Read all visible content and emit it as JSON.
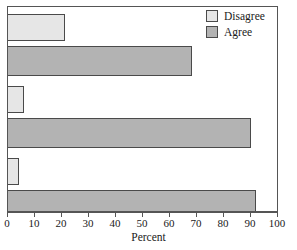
{
  "chart_data": {
    "type": "bar",
    "orientation": "horizontal",
    "title": "",
    "xlabel": "Percent",
    "ylabel": "",
    "xlim": [
      0,
      100
    ],
    "xticks": [
      0,
      10,
      20,
      30,
      40,
      50,
      60,
      70,
      80,
      90,
      100
    ],
    "xtick_labels": [
      "0",
      "10",
      "20",
      "30",
      "40",
      "50",
      "60",
      "70",
      "80",
      "90",
      "100"
    ],
    "ytick_labels": [
      "",
      "",
      ""
    ],
    "grid": false,
    "legend_position": "top-right",
    "categories": [
      "Item 1",
      "Item 2",
      "Item 3"
    ],
    "series": [
      {
        "name": "Disagree",
        "color": "#e6e6e6",
        "values": [
          21,
          6,
          4
        ]
      },
      {
        "name": "Agree",
        "color": "#b3b3b3",
        "values": [
          68,
          90,
          92
        ]
      }
    ],
    "bars": [
      {
        "group": 0,
        "series": "Disagree",
        "value": 21,
        "color": "#e6e6e6",
        "top": 7,
        "height": 27
      },
      {
        "group": 0,
        "series": "Agree",
        "value": 68,
        "color": "#b3b3b3",
        "top": 39,
        "height": 30
      },
      {
        "group": 1,
        "series": "Disagree",
        "value": 6,
        "color": "#e6e6e6",
        "top": 79,
        "height": 27
      },
      {
        "group": 1,
        "series": "Agree",
        "value": 90,
        "color": "#b3b3b3",
        "top": 111,
        "height": 30
      },
      {
        "group": 2,
        "series": "Disagree",
        "value": 4,
        "color": "#e6e6e6",
        "top": 151,
        "height": 27
      },
      {
        "group": 2,
        "series": "Agree",
        "value": 92,
        "color": "#b3b3b3",
        "top": 183,
        "height": 30
      }
    ]
  },
  "legend": {
    "items": [
      {
        "label": "Disagree",
        "swatch": "legend-swatch-disagree"
      },
      {
        "label": "Agree",
        "swatch": "legend-swatch-agree"
      }
    ]
  },
  "axis": {
    "x_title": "Percent"
  },
  "colors": {
    "disagree_fill": "#e6e6e6",
    "agree_fill": "#b3b3b3",
    "bar_stroke": "#4a4a4a",
    "frame": "#555555",
    "background": "#ffffff",
    "text": "#1a1a1a"
  }
}
